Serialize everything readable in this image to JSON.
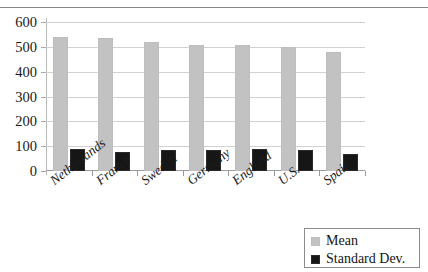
{
  "chart_data": {
    "type": "bar",
    "title": "",
    "xlabel": "",
    "ylabel": "",
    "ylim": [
      0,
      600
    ],
    "yticks": [
      0,
      100,
      200,
      300,
      400,
      500,
      600
    ],
    "ytick_labels": [
      "0",
      "100",
      "200",
      "300",
      "400",
      "500",
      "600"
    ],
    "grid": true,
    "legend_position": "bottom-right",
    "categories": [
      "Netherlands",
      "France",
      "Sweden",
      "Germany",
      "England",
      "U.S.",
      "Spain"
    ],
    "series": [
      {
        "name": "Mean",
        "color": "#c2c2c2",
        "values": [
          540,
          537,
          518,
          507,
          506,
          500,
          480
        ]
      },
      {
        "name": "Standard Dev.",
        "color": "#161616",
        "values": [
          88,
          76,
          84,
          84,
          90,
          85,
          68
        ]
      }
    ]
  },
  "legend": {
    "items": [
      {
        "label": "Mean",
        "swatch": "mean-swatch"
      },
      {
        "label": "Standard Dev.",
        "swatch": "standard-dev-swatch"
      }
    ]
  }
}
